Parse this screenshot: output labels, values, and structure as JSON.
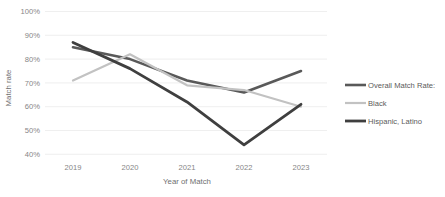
{
  "chart_data": {
    "type": "line",
    "title": "",
    "xlabel": "Year of Match",
    "ylabel": "Match rate",
    "categories": [
      "2019",
      "2020",
      "2021",
      "2022",
      "2023"
    ],
    "x": [
      2019,
      2020,
      2021,
      2022,
      2023
    ],
    "ylim": [
      40,
      100
    ],
    "ytick_labels": [
      "100%",
      "90%",
      "80%",
      "70%",
      "60%",
      "50%",
      "40%"
    ],
    "ytick_values": [
      100,
      90,
      80,
      70,
      60,
      50,
      40
    ],
    "grid": true,
    "legend_position": "right",
    "series": [
      {
        "name": "Overall Match Rate:",
        "color": "#595959",
        "values": [
          85,
          80,
          71,
          66,
          75
        ]
      },
      {
        "name": "Black",
        "color": "#c2c2c2",
        "values": [
          71,
          82,
          69,
          67,
          60
        ]
      },
      {
        "name": "Hispanic, Latino",
        "color": "#3f3f3f",
        "values": [
          87,
          76,
          62,
          44,
          61
        ]
      }
    ]
  },
  "axis": {
    "y_label": "Match rate",
    "x_label": "Year of Match",
    "y_ticks": [
      "100%",
      "90%",
      "80%",
      "70%",
      "60%",
      "50%",
      "40%"
    ],
    "x_ticks": [
      "2019",
      "2020",
      "2021",
      "2022",
      "2023"
    ]
  },
  "legend": {
    "entries": [
      {
        "label": "Overall Match Rate:",
        "color": "#595959"
      },
      {
        "label": "Black",
        "color": "#c2c2c2"
      },
      {
        "label": "Hispanic, Latino",
        "color": "#3f3f3f"
      }
    ]
  }
}
